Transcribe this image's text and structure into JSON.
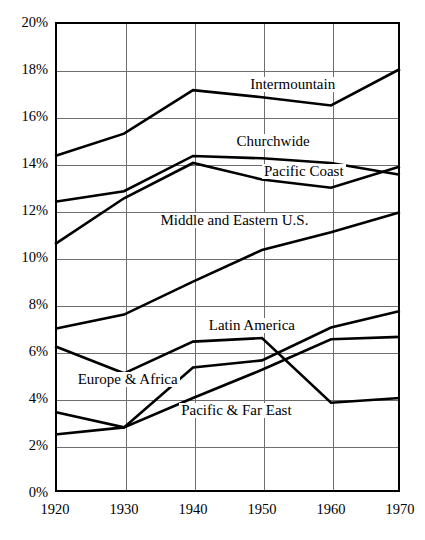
{
  "chart_data": {
    "type": "line",
    "title": "",
    "xlabel": "",
    "ylabel": "",
    "x": [
      1920,
      1930,
      1940,
      1950,
      1960,
      1970
    ],
    "xtick_labels": [
      "1920",
      "1930",
      "1940",
      "1950",
      "1960",
      "1970"
    ],
    "ytick_labels": [
      "0%",
      "2%",
      "4%",
      "6%",
      "8%",
      "10%",
      "12%",
      "14%",
      "16%",
      "18%",
      "20%"
    ],
    "ytick_values": [
      0,
      2,
      4,
      6,
      8,
      10,
      12,
      14,
      16,
      18,
      20
    ],
    "ylim": [
      0,
      20
    ],
    "xlim": [
      1920,
      1970
    ],
    "grid": true,
    "legend_position": "inline-labels",
    "units": "percent",
    "series": [
      {
        "name": "Intermountain",
        "values": [
          14.3,
          15.25,
          17.1,
          16.8,
          16.45,
          18.0
        ],
        "label_x_year": 1948,
        "label_y_pct": 17.3
      },
      {
        "name": "Churchwide",
        "values": [
          12.35,
          12.8,
          14.3,
          14.2,
          14.0,
          13.5
        ],
        "label_x_year": 1946,
        "label_y_pct": 14.9
      },
      {
        "name": "Pacific Coast",
        "values": [
          10.55,
          12.5,
          14.0,
          13.3,
          12.95,
          13.85
        ],
        "label_x_year": 1950,
        "label_y_pct": 13.6
      },
      {
        "name": "Middle and Eastern U.S.",
        "values": [
          6.95,
          7.55,
          8.95,
          10.3,
          11.05,
          11.9
        ],
        "label_x_year": 1935,
        "label_y_pct": 11.55
      },
      {
        "name": "Latin America",
        "values": [
          2.45,
          2.75,
          5.3,
          5.6,
          7.0,
          7.7
        ],
        "label_x_year": 1942,
        "label_y_pct": 7.05
      },
      {
        "name": "Europe & Africa",
        "values": [
          6.2,
          5.05,
          6.4,
          6.55,
          3.8,
          4.0
        ],
        "label_x_year": 1923,
        "label_y_pct": 4.75
      },
      {
        "name": "Pacific & Far East",
        "values": [
          3.4,
          2.75,
          4.0,
          5.2,
          6.5,
          6.6
        ],
        "label_x_year": 1938,
        "label_y_pct": 3.45
      }
    ]
  }
}
